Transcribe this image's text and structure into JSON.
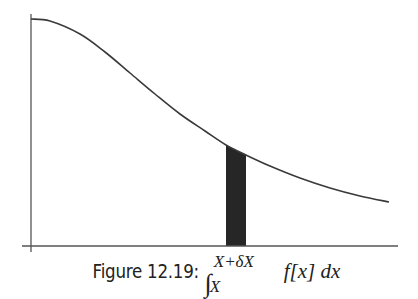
{
  "figure": {
    "caption_label": "Figure 12.19:",
    "caption_math": {
      "integral_sign": "∫",
      "upper_limit": "X+δX",
      "lower_limit": "X",
      "integrand": "f[x] dx"
    },
    "colors": {
      "curve": "#3a3a3a",
      "axes": "#555555",
      "strip": "#262626",
      "background": "#ffffff"
    }
  },
  "chart_data": {
    "type": "line",
    "xlabel": "",
    "ylabel": "",
    "grid": false,
    "legend": null,
    "curve_pixel_points": [
      [
        31,
        19
      ],
      [
        50,
        21
      ],
      [
        80,
        34
      ],
      [
        105,
        52
      ],
      [
        130,
        73
      ],
      [
        155,
        94
      ],
      [
        180,
        114
      ],
      [
        205,
        131
      ],
      [
        226,
        145
      ],
      [
        246,
        155
      ],
      [
        270,
        166
      ],
      [
        300,
        178
      ],
      [
        330,
        188
      ],
      [
        360,
        196
      ],
      [
        389,
        202
      ]
    ],
    "shaded_strip": {
      "x_start_px": 226,
      "x_end_px": 246,
      "label_lower": "X",
      "label_upper": "X+δX"
    },
    "axes_pixels": {
      "x_axis_y": 246,
      "x_axis_from": 22,
      "x_axis_to": 398,
      "y_axis_x": 31,
      "y_axis_from": 14,
      "y_axis_to": 252
    }
  }
}
